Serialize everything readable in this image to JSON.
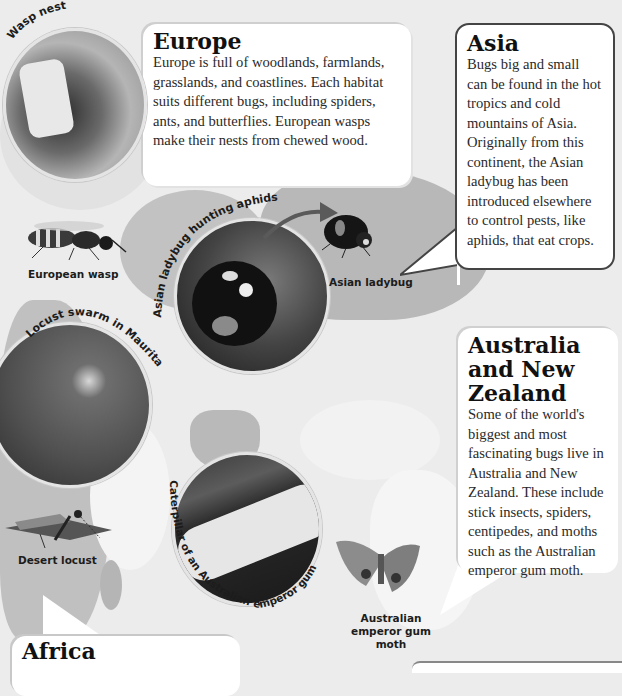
{
  "sections": {
    "europe": {
      "title": "Europe",
      "body": "Europe is full of woodlands, farmlands, grasslands, and coastlines. Each habitat suits different bugs, including spiders, ants, and butterflies. European wasps make their nests from chewed wood."
    },
    "asia": {
      "title": "Asia",
      "body": "Bugs big and small can be found in the hot tropics and cold mountains of Asia. Originally from this continent, the Asian ladybug has been introduced elsewhere to control pests, like aphids, that eat crops."
    },
    "australia": {
      "title": "Australia and New Zealand",
      "body": "Some of the world's biggest and most fascinating bugs live in Australia and New Zealand. These include stick insects, spiders, centipedes, and moths such as the Australian emperor gum moth."
    },
    "africa": {
      "title": "Africa"
    }
  },
  "photo_captions": {
    "wasp_nest": "Wasp nest",
    "ladybug_hunting": "Asian ladybug hunting aphids",
    "locust_swarm": "Locust swarm in Mauritania",
    "caterpillar": "Caterpillar of an Australian emperor gum moth"
  },
  "specimen_labels": {
    "european_wasp": "European wasp",
    "asian_ladybug": "Asian ladybug",
    "desert_locust": "Desert locust",
    "emperor_moth": "Australian emperor gum moth"
  }
}
